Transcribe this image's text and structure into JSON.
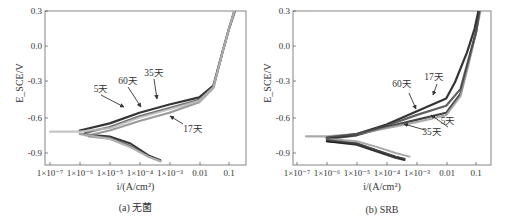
{
  "figure": {
    "note": "Axis ranges, tick labels, panel captions and annotation labels are read from the image. Series point values are visual approximations of curve shapes, not measured data."
  },
  "chart_data": [
    {
      "type": "line",
      "panel": "a",
      "caption": "(a) 无菌",
      "xlabel": "i/(A/cm²)",
      "ylabel": "E_SCE/V",
      "xscale": "log",
      "xlim": [
        5e-08,
        0.35
      ],
      "ylim": [
        -1.0,
        0.3
      ],
      "xticks": [
        "1×10⁻⁷",
        "1×10⁻⁶",
        "1×10⁻⁵",
        "1×10⁻⁴",
        "1×10⁻³",
        "0.01",
        "0.1"
      ],
      "yticks": [
        "0.3",
        "0.0",
        "-0.3",
        "-0.6",
        "-0.9"
      ],
      "grid": false,
      "legend": "inline annotations with arrows",
      "values_are_approximate": true,
      "series": [
        {
          "name": "5天",
          "color": "#111111",
          "anodic": [
            [
              1e-06,
              -0.71
            ],
            [
              1e-05,
              -0.65
            ],
            [
              0.0001,
              -0.56
            ],
            [
              0.001,
              -0.49
            ],
            [
              0.01,
              -0.43
            ],
            [
              0.03,
              -0.33
            ],
            [
              0.06,
              -0.05
            ],
            [
              0.1,
              0.15
            ],
            [
              0.15,
              0.3
            ]
          ],
          "cathodic": [
            [
              1e-06,
              -0.74
            ],
            [
              1e-05,
              -0.76
            ],
            [
              5e-05,
              -0.82
            ],
            [
              0.0002,
              -0.92
            ],
            [
              0.0005,
              -0.96
            ]
          ]
        },
        {
          "name": "17天",
          "color": "#8a8a8a",
          "anodic": [
            [
              2e-06,
              -0.75
            ],
            [
              1e-05,
              -0.71
            ],
            [
              0.0001,
              -0.63
            ],
            [
              0.001,
              -0.56
            ],
            [
              0.01,
              -0.47
            ],
            [
              0.03,
              -0.35
            ],
            [
              0.06,
              -0.05
            ],
            [
              0.1,
              0.15
            ],
            [
              0.16,
              0.3
            ]
          ],
          "cathodic": [
            [
              2e-06,
              -0.76
            ],
            [
              1e-05,
              -0.78
            ],
            [
              5e-05,
              -0.85
            ],
            [
              0.0002,
              -0.93
            ],
            [
              0.0005,
              -0.97
            ]
          ]
        },
        {
          "name": "35天",
          "color": "#555555",
          "anodic": [
            [
              1.5e-06,
              -0.73
            ],
            [
              1e-05,
              -0.68
            ],
            [
              0.0001,
              -0.59
            ],
            [
              0.001,
              -0.52
            ],
            [
              0.01,
              -0.45
            ],
            [
              0.03,
              -0.34
            ],
            [
              0.06,
              -0.05
            ],
            [
              0.1,
              0.15
            ],
            [
              0.155,
              0.3
            ]
          ],
          "cathodic": [
            [
              1.5e-06,
              -0.75
            ],
            [
              1e-05,
              -0.77
            ],
            [
              5e-05,
              -0.84
            ],
            [
              0.0002,
              -0.93
            ],
            [
              0.0005,
              -0.965
            ]
          ]
        },
        {
          "name": "60天",
          "color": "#bbbbbb",
          "anodic": [
            [
              1e-07,
              -0.72
            ],
            [
              1e-06,
              -0.72
            ],
            [
              1e-05,
              -0.69
            ],
            [
              0.0001,
              -0.6
            ],
            [
              0.001,
              -0.53
            ],
            [
              0.01,
              -0.46
            ],
            [
              0.03,
              -0.345
            ],
            [
              0.06,
              -0.05
            ],
            [
              0.1,
              0.15
            ],
            [
              0.15,
              0.3
            ]
          ],
          "cathodic": [
            [
              1e-06,
              -0.74
            ],
            [
              1e-05,
              -0.78
            ],
            [
              5e-05,
              -0.85
            ],
            [
              0.0002,
              -0.93
            ],
            [
              0.0005,
              -0.97
            ]
          ]
        }
      ],
      "annotations": [
        {
          "text": "5天",
          "label_xy": [
            101,
            92
          ],
          "arrow_to": [
            124,
            107
          ]
        },
        {
          "text": "60天",
          "label_xy": [
            128,
            84
          ],
          "arrow_to": [
            141,
            107
          ]
        },
        {
          "text": "35天",
          "label_xy": [
            154,
            76
          ],
          "arrow_to": [
            157,
            99
          ]
        },
        {
          "text": "17天",
          "label_xy": [
            193,
            132
          ],
          "arrow_to": [
            170,
            116
          ],
          "arrow_from": [
            183,
            124
          ]
        }
      ]
    },
    {
      "type": "line",
      "panel": "b",
      "caption": "(b) SRB",
      "xlabel": "i/(A/cm²)",
      "ylabel": "E_SCE/V",
      "xscale": "log",
      "xlim": [
        5e-08,
        0.35
      ],
      "ylim": [
        -1.0,
        0.3
      ],
      "xticks": [
        "1×10⁻⁷",
        "1×10⁻⁶",
        "1×10⁻⁵",
        "1×10⁻⁴",
        "1×10⁻³",
        "0.01",
        "0.1"
      ],
      "yticks": [
        "0.3",
        "0.0",
        "-0.3",
        "-0.6",
        "-0.9"
      ],
      "grid": false,
      "legend": "inline annotations with arrows",
      "values_are_approximate": true,
      "series": [
        {
          "name": "5天",
          "color": "#222222",
          "anodic": [
            [
              1e-06,
              -0.78
            ],
            [
              1e-05,
              -0.75
            ],
            [
              0.0001,
              -0.68
            ],
            [
              0.001,
              -0.62
            ],
            [
              0.01,
              -0.56
            ],
            [
              0.03,
              -0.4
            ],
            [
              0.06,
              -0.1
            ],
            [
              0.1,
              0.12
            ],
            [
              0.13,
              0.3
            ]
          ],
          "cathodic": [
            [
              1e-06,
              -0.8
            ],
            [
              1e-05,
              -0.82
            ],
            [
              5e-05,
              -0.88
            ],
            [
              0.0002,
              -0.93
            ],
            [
              0.0004,
              -0.95
            ]
          ]
        },
        {
          "name": "17天",
          "color": "#111111",
          "anodic": [
            [
              1e-06,
              -0.77
            ],
            [
              1e-05,
              -0.74
            ],
            [
              0.0001,
              -0.66
            ],
            [
              0.001,
              -0.55
            ],
            [
              0.01,
              -0.44
            ],
            [
              0.02,
              -0.3
            ],
            [
              0.05,
              -0.05
            ],
            [
              0.09,
              0.15
            ],
            [
              0.12,
              0.3
            ]
          ],
          "cathodic": [
            [
              1e-06,
              -0.8
            ],
            [
              1e-05,
              -0.83
            ],
            [
              5e-05,
              -0.89
            ],
            [
              0.0002,
              -0.94
            ],
            [
              0.0004,
              -0.96
            ]
          ]
        },
        {
          "name": "35天",
          "color": "#9a9a9a",
          "anodic": [
            [
              2e-07,
              -0.76
            ],
            [
              1e-06,
              -0.76
            ],
            [
              1e-05,
              -0.74
            ],
            [
              0.0001,
              -0.69
            ],
            [
              0.001,
              -0.64
            ],
            [
              0.01,
              -0.58
            ],
            [
              0.03,
              -0.42
            ],
            [
              0.06,
              -0.12
            ],
            [
              0.1,
              0.12
            ],
            [
              0.14,
              0.3
            ]
          ],
          "cathodic": [
            [
              1e-06,
              -0.78
            ],
            [
              1e-05,
              -0.8
            ],
            [
              5e-05,
              -0.85
            ],
            [
              0.0002,
              -0.9
            ],
            [
              0.0006,
              -0.93
            ]
          ]
        },
        {
          "name": "60天",
          "color": "#444444",
          "anodic": [
            [
              1e-06,
              -0.77
            ],
            [
              1e-05,
              -0.74
            ],
            [
              0.0001,
              -0.67
            ],
            [
              0.001,
              -0.58
            ],
            [
              0.01,
              -0.5
            ],
            [
              0.03,
              -0.36
            ],
            [
              0.06,
              -0.08
            ],
            [
              0.1,
              0.12
            ],
            [
              0.13,
              0.3
            ]
          ],
          "cathodic": [
            [
              1e-06,
              -0.79
            ],
            [
              1e-05,
              -0.82
            ],
            [
              5e-05,
              -0.88
            ],
            [
              0.0002,
              -0.93
            ],
            [
              0.0004,
              -0.95
            ]
          ]
        }
      ],
      "annotations": [
        {
          "text": "60天",
          "label_xy": [
            402,
            87
          ],
          "arrow_to": [
            416,
            109
          ],
          "arrow_from": [
            409,
            93
          ]
        },
        {
          "text": "17天",
          "label_xy": [
            434,
            80
          ],
          "arrow_to": [
            433,
            95
          ],
          "arrow_from": [
            437,
            84
          ]
        },
        {
          "text": "5天",
          "label_xy": [
            448,
            124
          ],
          "arrow_to": [
            431,
            115
          ]
        },
        {
          "text": "35天",
          "label_xy": [
            432,
            135
          ],
          "arrow_to": [
            404,
            124
          ],
          "arrow_from": [
            425,
            130
          ]
        }
      ]
    }
  ],
  "layout": {
    "panels": [
      {
        "id": "a",
        "frame": {
          "left": 45,
          "right": 246,
          "top": 11,
          "bottom": 165
        },
        "x_ticks_px": [
          50,
          80,
          110,
          140,
          170,
          200,
          229
        ]
      },
      {
        "id": "b",
        "frame": {
          "left": 293,
          "right": 491,
          "top": 11,
          "bottom": 165
        },
        "x_ticks_px": [
          297,
          327,
          357,
          387,
          417,
          447,
          476
        ]
      }
    ],
    "y_ticks_px": [
      11,
      46,
      81,
      118,
      153
    ]
  }
}
